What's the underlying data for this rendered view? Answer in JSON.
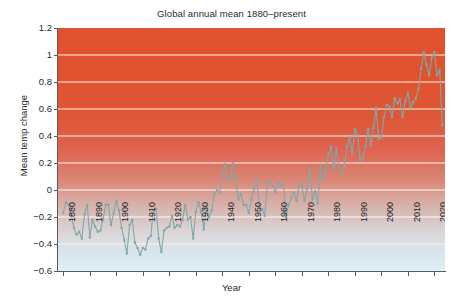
{
  "chart_data": {
    "type": "line",
    "title": "Global annual mean 1880–present",
    "xlabel": "Year",
    "ylabel": "Mean temp change",
    "xlim": [
      1878,
      2024
    ],
    "ylim": [
      -0.6,
      1.2
    ],
    "yticks": [
      1.2,
      1,
      0.8,
      0.6,
      0.4,
      0.2,
      0,
      -0.2,
      -0.4,
      -0.6
    ],
    "ytick_labels": [
      "1.2",
      "1",
      "0.8",
      "0.6",
      "0.4",
      "0.2",
      "0",
      "−0.2",
      "−0.4",
      "−0.6"
    ],
    "xticks": [
      1880,
      1890,
      1900,
      1910,
      1920,
      1930,
      1940,
      1950,
      1960,
      1970,
      1980,
      1990,
      2000,
      2010,
      2020
    ],
    "xtick_labels": [
      "1880",
      "1890",
      "1900",
      "1910",
      "1920",
      "1930",
      "1940",
      "1950",
      "1960",
      "1970",
      "1980",
      "1990",
      "2000",
      "2010",
      "2020"
    ],
    "grid": "horizontal-white",
    "legend": "none",
    "series": [
      {
        "name": "Global annual mean temperature anomaly",
        "line_color": "#7fa8ad",
        "marker": "circle",
        "x": [
          1880,
          1881,
          1882,
          1883,
          1884,
          1885,
          1886,
          1887,
          1888,
          1889,
          1890,
          1891,
          1892,
          1893,
          1894,
          1895,
          1896,
          1897,
          1898,
          1899,
          1900,
          1901,
          1902,
          1903,
          1904,
          1905,
          1906,
          1907,
          1908,
          1909,
          1910,
          1911,
          1912,
          1913,
          1914,
          1915,
          1916,
          1917,
          1918,
          1919,
          1920,
          1921,
          1922,
          1923,
          1924,
          1925,
          1926,
          1927,
          1928,
          1929,
          1930,
          1931,
          1932,
          1933,
          1934,
          1935,
          1936,
          1937,
          1938,
          1939,
          1940,
          1941,
          1942,
          1943,
          1944,
          1945,
          1946,
          1947,
          1948,
          1949,
          1950,
          1951,
          1952,
          1953,
          1954,
          1955,
          1956,
          1957,
          1958,
          1959,
          1960,
          1961,
          1962,
          1963,
          1964,
          1965,
          1966,
          1967,
          1968,
          1969,
          1970,
          1971,
          1972,
          1973,
          1974,
          1975,
          1976,
          1977,
          1978,
          1979,
          1980,
          1981,
          1982,
          1983,
          1984,
          1985,
          1986,
          1987,
          1988,
          1989,
          1990,
          1991,
          1992,
          1993,
          1994,
          1995,
          1996,
          1997,
          1998,
          1999,
          2000,
          2001,
          2002,
          2003,
          2004,
          2005,
          2006,
          2007,
          2008,
          2009,
          2010,
          2011,
          2012,
          2013,
          2014,
          2015,
          2016,
          2017,
          2018,
          2019,
          2020,
          2021,
          2022,
          2023
        ],
        "y": [
          -0.17,
          -0.09,
          -0.11,
          -0.18,
          -0.28,
          -0.33,
          -0.31,
          -0.36,
          -0.18,
          -0.11,
          -0.35,
          -0.22,
          -0.27,
          -0.31,
          -0.3,
          -0.22,
          -0.11,
          -0.11,
          -0.26,
          -0.17,
          -0.08,
          -0.15,
          -0.28,
          -0.37,
          -0.47,
          -0.26,
          -0.22,
          -0.39,
          -0.43,
          -0.48,
          -0.43,
          -0.44,
          -0.36,
          -0.34,
          -0.15,
          -0.14,
          -0.36,
          -0.46,
          -0.3,
          -0.28,
          -0.27,
          -0.19,
          -0.28,
          -0.26,
          -0.27,
          -0.22,
          -0.11,
          -0.22,
          -0.2,
          -0.36,
          -0.16,
          -0.09,
          -0.16,
          -0.29,
          -0.13,
          -0.2,
          -0.15,
          -0.03,
          0.0,
          -0.02,
          0.13,
          0.19,
          0.07,
          0.09,
          0.2,
          0.09,
          -0.07,
          -0.03,
          -0.11,
          -0.11,
          -0.17,
          -0.07,
          0.01,
          0.08,
          -0.13,
          -0.14,
          -0.19,
          0.05,
          0.06,
          0.03,
          -0.02,
          0.06,
          0.03,
          0.05,
          -0.2,
          -0.11,
          -0.06,
          -0.02,
          -0.08,
          0.05,
          0.03,
          -0.08,
          0.01,
          0.16,
          -0.07,
          -0.01,
          -0.1,
          0.18,
          0.07,
          0.16,
          0.26,
          0.32,
          0.14,
          0.31,
          0.16,
          0.12,
          0.18,
          0.32,
          0.39,
          0.27,
          0.45,
          0.41,
          0.22,
          0.23,
          0.32,
          0.45,
          0.33,
          0.46,
          0.61,
          0.38,
          0.39,
          0.54,
          0.63,
          0.62,
          0.54,
          0.68,
          0.64,
          0.67,
          0.54,
          0.66,
          0.72,
          0.61,
          0.65,
          0.68,
          0.75,
          0.9,
          1.02,
          0.93,
          0.85,
          0.98,
          1.02,
          0.85,
          0.89,
          0.48
        ]
      }
    ]
  }
}
